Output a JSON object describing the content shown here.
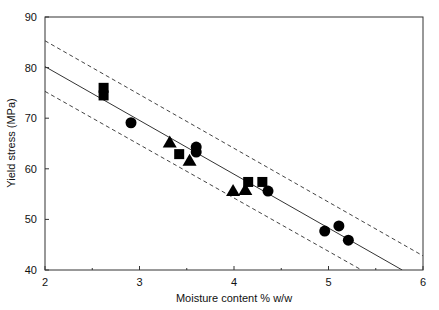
{
  "chart_data": {
    "type": "scatter",
    "title": "",
    "xlabel": "Moisture content % w/w",
    "ylabel": "Yield stress (MPa)",
    "xlim": [
      2,
      6
    ],
    "ylim": [
      40,
      90
    ],
    "xticks": [
      2,
      3,
      4,
      5,
      6
    ],
    "xminor_ticks": [
      2.5,
      3.5,
      4.5,
      5.5
    ],
    "yticks": [
      40,
      50,
      60,
      70,
      80,
      90
    ],
    "grid": false,
    "legend": null,
    "series": [
      {
        "name": "squares",
        "marker": "square",
        "points": [
          {
            "x": 2.62,
            "y": 76.0
          },
          {
            "x": 2.62,
            "y": 74.5
          },
          {
            "x": 3.42,
            "y": 62.9
          },
          {
            "x": 4.15,
            "y": 57.4
          },
          {
            "x": 4.3,
            "y": 57.4
          }
        ]
      },
      {
        "name": "circles",
        "marker": "circle",
        "points": [
          {
            "x": 2.91,
            "y": 69.1
          },
          {
            "x": 3.6,
            "y": 64.3
          },
          {
            "x": 3.6,
            "y": 63.3
          },
          {
            "x": 4.36,
            "y": 55.6
          },
          {
            "x": 4.96,
            "y": 47.7
          },
          {
            "x": 5.11,
            "y": 48.7
          },
          {
            "x": 5.21,
            "y": 45.9
          }
        ]
      },
      {
        "name": "triangles",
        "marker": "triangle",
        "points": [
          {
            "x": 3.32,
            "y": 65.2
          },
          {
            "x": 3.53,
            "y": 61.6
          },
          {
            "x": 3.99,
            "y": 55.6
          },
          {
            "x": 4.12,
            "y": 55.8
          }
        ]
      }
    ],
    "lines": [
      {
        "name": "regression",
        "style": "solid",
        "x": [
          2,
          5.78
        ],
        "y": [
          80.2,
          40
        ]
      },
      {
        "name": "upper-bound",
        "style": "dashed",
        "x": [
          2,
          6
        ],
        "y": [
          85.3,
          42.8
        ]
      },
      {
        "name": "lower-bound",
        "style": "dashed",
        "x": [
          2,
          5.35
        ],
        "y": [
          75.3,
          40
        ]
      }
    ]
  },
  "plot_box": {
    "left": 45,
    "right": 423,
    "top": 17,
    "bottom": 270
  }
}
